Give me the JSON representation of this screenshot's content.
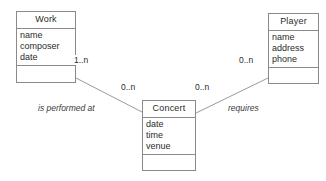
{
  "diagram": {
    "type": "uml-class-diagram",
    "line_color": "#9a9a9a",
    "border_color": "#8a8a8a",
    "text_color": "#2b2b2b",
    "background": "#ffffff",
    "classes": [
      {
        "id": "work",
        "name": "Work",
        "attributes": [
          "name",
          "composer",
          "date"
        ],
        "operations": []
      },
      {
        "id": "concert",
        "name": "Concert",
        "attributes": [
          "date",
          "time",
          "venue"
        ],
        "operations": []
      },
      {
        "id": "player",
        "name": "Player",
        "attributes": [
          "name",
          "address",
          "phone"
        ],
        "operations": []
      }
    ],
    "associations": [
      {
        "id": "is-performed-at",
        "label": "is performed at",
        "from": "work",
        "to": "concert",
        "from_multiplicity": "1..n",
        "to_multiplicity": "0..n"
      },
      {
        "id": "requires",
        "label": "requires",
        "from": "concert",
        "to": "player",
        "from_multiplicity": "0..n",
        "to_multiplicity": "0..n"
      }
    ]
  }
}
